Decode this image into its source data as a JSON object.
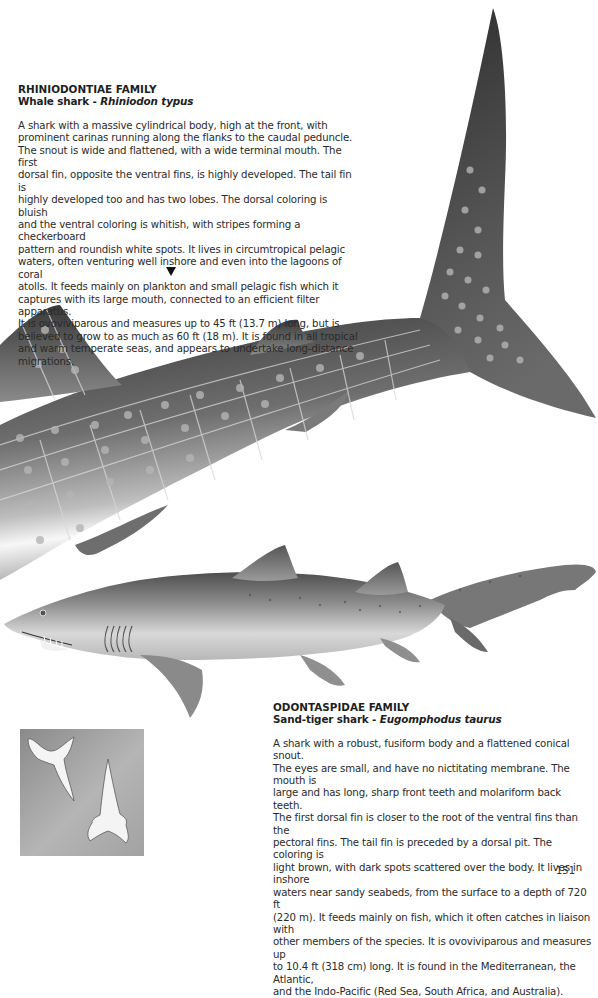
{
  "page": {
    "number": "151",
    "background": "#ffffff"
  },
  "entries": [
    {
      "family": "RHINIODONTIAE FAMILY",
      "common_name": "Whale shark - ",
      "scientific_name": "Rhiniodon typus",
      "description": "A shark with a massive cylindrical body, high at the front, with\nprominent carinas running along the flanks to the caudal peduncle.\nThe snout is wide and flattened, with a wide terminal mouth. The first\ndorsal fin, opposite the ventral fins, is highly developed. The tail fin is\nhighly developed too and has two lobes. The dorsal coloring is bluish\nand the ventral coloring is whitish, with stripes forming a checkerboard\npattern and roundish white spots. It lives in circumtropical pelagic\nwaters, often venturing well inshore and even into the lagoons of coral\natolls. It feeds mainly on plankton and small pelagic fish which it\ncaptures with its large mouth, connected to an efficient filter apparatus.\nIt is ovoviviparous and measures up to 45 ft (13.7 m) long, but is\nbelieved to grow to as much as 60 ft (18 m). It is found in all tropical\nand warm temperate seas, and appears to undertake long-distance\nmigrations.",
      "pointer_icon": "down-triangle"
    },
    {
      "family": "ODONTASPIDAE FAMILY",
      "common_name": "Sand-tiger shark - ",
      "scientific_name": "Eugomphodus taurus",
      "description": "A shark with a robust, fusiform body and a flattened conical snout.\nThe eyes are small, and have no nictitating membrane. The mouth is\nlarge and has long, sharp front teeth and molariform back teeth.\nThe first dorsal fin is closer to the root of the ventral fins than the\npectoral fins. The tail fin is preceded by a dorsal pit. The coloring is\nlight brown, with dark spots scattered over the body. It lives in inshore\nwaters near sandy seabeds, from the surface to a depth of 720 ft\n(220 m). It feeds mainly on fish, which it often catches in liaison with\nother members of the species. It is ovoviviparous and measures up\nto 10.4 ft (318 cm) long. It is found in the Mediterranean, the Atlantic,\nand the Indo-Pacific (Red Sea, South Africa, and Australia)."
    }
  ],
  "illustrations": [
    {
      "name": "whale-shark-illustration",
      "colors": {
        "dorsal": "#3c3c3c",
        "mid": "#7a7a7a",
        "belly": "#f2f2f2",
        "spots": "#a8a8a8"
      }
    },
    {
      "name": "sand-tiger-shark-illustration",
      "colors": {
        "dorsal": "#5a5a5a",
        "mid": "#9a9a9a",
        "belly": "#e6e6e6"
      }
    },
    {
      "name": "shark-teeth-inset",
      "colors": {
        "background": "#a0a0a0",
        "tooth": "#f4f4f4"
      }
    }
  ]
}
